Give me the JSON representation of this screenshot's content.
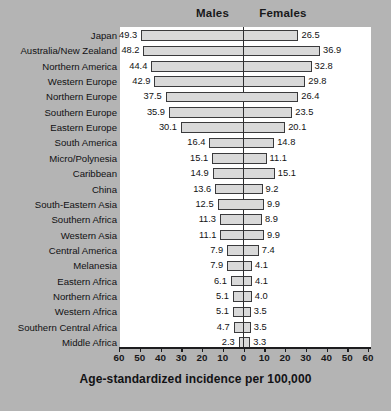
{
  "header": {
    "males_label": "Males",
    "females_label": "Females"
  },
  "axis": {
    "title": "Age-standardized incidence per 100,000",
    "ticks": [
      "60",
      "50",
      "40",
      "30",
      "20",
      "10",
      "0",
      "10",
      "20",
      "30",
      "40",
      "50",
      "60"
    ],
    "max": 60
  },
  "caption": "",
  "colors": {
    "background": "#b4b4b4",
    "panel": "#ffffff",
    "bar_fill": "#d9d9d9",
    "bar_stroke": "#3a3a3c",
    "text": "#121214"
  },
  "chart_data": {
    "type": "bar",
    "orientation": "horizontal-diverging",
    "title": "",
    "xlabel": "Age-standardized incidence per 100,000",
    "ylabel": "",
    "xlim": [
      -60,
      60
    ],
    "grid": false,
    "legend_position": "top",
    "categories": [
      "Japan",
      "Australia/New Zealand",
      "Northern America",
      "Western Europe",
      "Northern Europe",
      "Southern Europe",
      "Eastern Europe",
      "South America",
      "Micro/Polynesia",
      "Caribbean",
      "China",
      "South-Eastern Asia",
      "Southern Africa",
      "Western Asia",
      "Central America",
      "Melanesia",
      "Eastern Africa",
      "Northern Africa",
      "Western Africa",
      "Southern Central Africa",
      "Middle Africa"
    ],
    "series": [
      {
        "name": "Males",
        "values": [
          49.3,
          48.2,
          44.4,
          42.9,
          37.5,
          35.9,
          30.1,
          16.4,
          15.1,
          14.9,
          13.6,
          12.5,
          11.3,
          11.1,
          7.9,
          7.9,
          6.1,
          5.1,
          5.1,
          4.7,
          2.3
        ]
      },
      {
        "name": "Females",
        "values": [
          26.5,
          36.9,
          32.8,
          29.8,
          26.4,
          23.5,
          20.1,
          14.8,
          11.1,
          15.1,
          9.2,
          9.9,
          8.9,
          9.9,
          7.4,
          4.1,
          4.1,
          4.0,
          3.5,
          3.5,
          3.3
        ]
      }
    ]
  }
}
